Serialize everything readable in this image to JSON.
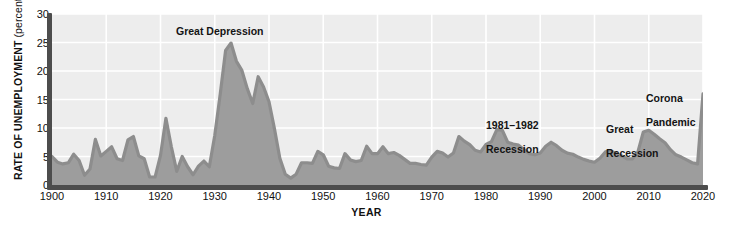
{
  "chart_data": {
    "type": "area",
    "title": "",
    "xlabel": "YEAR",
    "ylabel": "RATE OF UNEMPLOYMENT",
    "ylabel_unit": "(percent)",
    "ylim": [
      0,
      30
    ],
    "xlim": [
      1900,
      2020
    ],
    "yticks": [
      0,
      5,
      10,
      15,
      20,
      25,
      30
    ],
    "xticks": [
      1900,
      1910,
      1920,
      1930,
      1940,
      1950,
      1960,
      1970,
      1980,
      1990,
      2000,
      2010,
      2020
    ],
    "grid": true,
    "legend": "none",
    "series_name": "Rate of unemployment",
    "x": [
      1900,
      1901,
      1902,
      1903,
      1904,
      1905,
      1906,
      1907,
      1908,
      1909,
      1910,
      1911,
      1912,
      1913,
      1914,
      1915,
      1916,
      1917,
      1918,
      1919,
      1920,
      1921,
      1922,
      1923,
      1924,
      1925,
      1926,
      1927,
      1928,
      1929,
      1930,
      1931,
      1932,
      1933,
      1934,
      1935,
      1936,
      1937,
      1938,
      1939,
      1940,
      1941,
      1942,
      1943,
      1944,
      1945,
      1946,
      1947,
      1948,
      1949,
      1950,
      1951,
      1952,
      1953,
      1954,
      1955,
      1956,
      1957,
      1958,
      1959,
      1960,
      1961,
      1962,
      1963,
      1964,
      1965,
      1966,
      1967,
      1968,
      1969,
      1970,
      1971,
      1972,
      1973,
      1974,
      1975,
      1976,
      1977,
      1978,
      1979,
      1980,
      1981,
      1982,
      1983,
      1984,
      1985,
      1986,
      1987,
      1988,
      1989,
      1990,
      1991,
      1992,
      1993,
      1994,
      1995,
      1996,
      1997,
      1998,
      1999,
      2000,
      2001,
      2002,
      2003,
      2004,
      2005,
      2006,
      2007,
      2008,
      2009,
      2010,
      2011,
      2012,
      2013,
      2014,
      2015,
      2016,
      2017,
      2018,
      2019,
      2020
    ],
    "values": [
      5.0,
      4.0,
      3.7,
      3.9,
      5.4,
      4.3,
      1.7,
      2.8,
      8.0,
      5.1,
      5.9,
      6.7,
      4.6,
      4.3,
      7.9,
      8.5,
      5.1,
      4.6,
      1.4,
      1.4,
      5.2,
      11.7,
      6.7,
      2.4,
      5.0,
      3.2,
      1.8,
      3.3,
      4.2,
      3.2,
      8.7,
      15.9,
      23.6,
      24.9,
      21.7,
      20.1,
      16.9,
      14.3,
      19.0,
      17.2,
      14.6,
      9.9,
      4.7,
      1.9,
      1.2,
      1.9,
      3.9,
      3.9,
      3.8,
      5.9,
      5.3,
      3.3,
      3.0,
      2.9,
      5.5,
      4.4,
      4.1,
      4.3,
      6.8,
      5.5,
      5.5,
      6.7,
      5.5,
      5.7,
      5.2,
      4.5,
      3.8,
      3.8,
      3.6,
      3.5,
      4.9,
      5.9,
      5.6,
      4.9,
      5.6,
      8.5,
      7.7,
      7.1,
      6.1,
      5.8,
      7.1,
      7.6,
      9.7,
      9.6,
      7.5,
      7.2,
      7.0,
      6.2,
      5.5,
      5.3,
      5.6,
      6.8,
      7.5,
      6.9,
      6.1,
      5.6,
      5.4,
      4.9,
      4.5,
      4.2,
      4.0,
      4.7,
      5.8,
      6.0,
      5.5,
      5.1,
      4.6,
      4.6,
      5.8,
      9.3,
      9.6,
      8.9,
      8.1,
      7.4,
      6.2,
      5.3,
      4.9,
      4.4,
      3.9,
      3.7,
      16.0
    ],
    "annotations": [
      {
        "id": "great-depression",
        "text": "Great Depression",
        "year": 1932,
        "value": 25
      },
      {
        "id": "recession-1981-1982",
        "text": "1981–1982\nRecession",
        "year": 1982,
        "value": 14
      },
      {
        "id": "great-recession",
        "text": "Great\nRecession",
        "year": 2009,
        "value": 13
      },
      {
        "id": "corona-pandemic",
        "text": "Corona\nPandemic",
        "year": 2019,
        "value": 18
      }
    ],
    "colors": {
      "plot_background": "#ededed",
      "area_fill": "#9d9d9d",
      "line": "#8d8d8d",
      "gridline": "#ffffff",
      "axis": "#4d4d4d",
      "text": "#141414",
      "page_background": "#ffffff"
    }
  },
  "axes": {
    "y_title_main": "RATE OF UNEMPLOYMENT",
    "y_title_unit": "(percent)",
    "x_title": "YEAR",
    "y_tick_labels": [
      "30",
      "25",
      "20",
      "15",
      "10",
      "5",
      "0"
    ],
    "x_tick_labels": [
      "1900",
      "1910",
      "1920",
      "1930",
      "1940",
      "1950",
      "1960",
      "1970",
      "1980",
      "1990",
      "2000",
      "2010",
      "2020"
    ]
  },
  "annotations": {
    "great_depression": "Great Depression",
    "recession_1981_1982_line1": "1981–1982",
    "recession_1981_1982_line2": "Recession",
    "great_recession_line1": "Great",
    "great_recession_line2": "Recession",
    "corona_line1": "Corona",
    "corona_line2": "Pandemic"
  }
}
